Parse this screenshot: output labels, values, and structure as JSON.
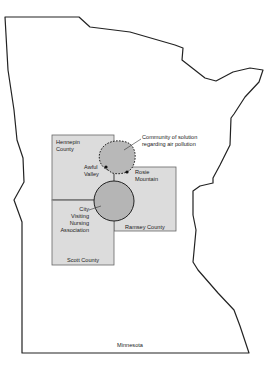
{
  "diagram": {
    "state_label": "Minnesota",
    "counties": [
      {
        "name": "Hennepin County",
        "line1": "Hennepin",
        "line2": "County"
      },
      {
        "name": "Ramsey County",
        "line1": "Ramsey County"
      },
      {
        "name": "Scott County",
        "line1": "Scott County"
      }
    ],
    "places": {
      "awful_valley": {
        "line1": "Awful",
        "line2": "Valley"
      },
      "rosie_mountain": {
        "line1": "Rosie",
        "line2": "Mountain"
      }
    },
    "community_of_solution": {
      "line1": "Community of solution",
      "line2": "regarding air pollution"
    },
    "city_nursing": {
      "line1": "City",
      "line2": "Visiting",
      "line3": "Nursing",
      "line4": "Association"
    },
    "colors": {
      "outline": "#222222",
      "county_fill": "#dcdcdc",
      "county_stroke": "#555555",
      "community_fill": "#b8b8b8",
      "circle_fill": "#b5b5b5"
    }
  }
}
